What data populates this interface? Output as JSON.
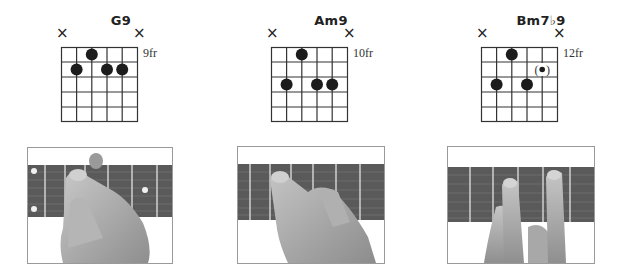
{
  "chords": [
    {
      "name": "G9",
      "fret_label": "9fr",
      "left": 56,
      "grid_left": 61,
      "muted_strings": [
        1,
        6
      ],
      "dots": [
        {
          "string": 3,
          "fret": 1,
          "optional": false
        },
        {
          "string": 2,
          "fret": 2,
          "optional": false
        },
        {
          "string": 4,
          "fret": 2,
          "optional": false
        },
        {
          "string": 5,
          "fret": 2,
          "optional": false
        }
      ]
    },
    {
      "name": "Am9",
      "fret_label": "10fr",
      "left": 266,
      "grid_left": 271,
      "muted_strings": [
        1,
        6
      ],
      "dots": [
        {
          "string": 3,
          "fret": 1,
          "optional": false
        },
        {
          "string": 2,
          "fret": 3,
          "optional": false
        },
        {
          "string": 4,
          "fret": 3,
          "optional": false
        },
        {
          "string": 5,
          "fret": 3,
          "optional": false
        }
      ]
    },
    {
      "name": "Bm7♭9",
      "fret_label": "12fr",
      "left": 476,
      "grid_left": 481,
      "muted_strings": [
        1,
        6
      ],
      "dots": [
        {
          "string": 3,
          "fret": 1,
          "optional": false
        },
        {
          "string": 5,
          "fret": 2,
          "optional": true
        },
        {
          "string": 2,
          "fret": 3,
          "optional": false
        },
        {
          "string": 4,
          "fret": 3,
          "optional": false
        }
      ]
    }
  ],
  "photos": [
    {
      "alt": "Hand fretting G9 chord on guitar neck",
      "left": 27,
      "top": 147,
      "width": 144,
      "height": 115
    },
    {
      "alt": "Hand fretting Am9 chord on guitar neck",
      "left": 237,
      "top": 146,
      "width": 146,
      "height": 116
    },
    {
      "alt": "Hand fretting Bm7b9 chord on guitar neck",
      "left": 447,
      "top": 146,
      "width": 146,
      "height": 116
    }
  ],
  "symbols": {
    "mute": "×",
    "optional_open": "(",
    "optional_close": ")"
  }
}
